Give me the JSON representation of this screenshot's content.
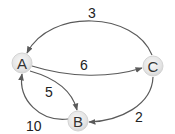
{
  "diagram": {
    "type": "directed-weighted-graph",
    "nodes": [
      {
        "id": "A",
        "label": "A"
      },
      {
        "id": "B",
        "label": "B"
      },
      {
        "id": "C",
        "label": "C"
      }
    ],
    "edges": [
      {
        "from": "C",
        "to": "A",
        "weight": "3"
      },
      {
        "from": "A",
        "to": "C",
        "weight": "6"
      },
      {
        "from": "A",
        "to": "B",
        "weight": "5"
      },
      {
        "from": "B",
        "to": "A",
        "weight": "10"
      },
      {
        "from": "C",
        "to": "B",
        "weight": "2"
      }
    ],
    "colors": {
      "edge": "#5a5a5a",
      "node_fill": "#e6e6e6",
      "node_text": "#333333",
      "label_text": "#222222"
    }
  }
}
